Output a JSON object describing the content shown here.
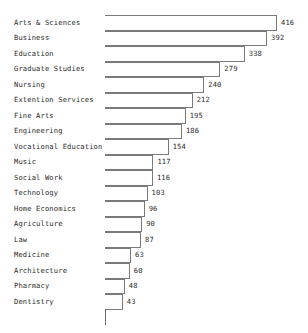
{
  "chart_data": {
    "type": "bar",
    "orientation": "horizontal",
    "title": "",
    "subtitle": "",
    "xlabel": "",
    "ylabel": "",
    "grid": false,
    "legend": false,
    "legend_position": "none",
    "xlim": [
      0,
      416
    ],
    "axis_origin": 0,
    "categories": [
      "Arts & Sciences",
      "Business",
      "Education",
      "Graduate Studies",
      "Nursing",
      "Extention Services",
      "Fine Arts",
      "Engineering",
      "Vocational Education",
      "Music",
      "Social Work",
      "Technology",
      "Home Economics",
      "Agriculture",
      "Law",
      "Medicine",
      "Architecture",
      "Pharmacy",
      "Dentistry"
    ],
    "values": [
      416,
      392,
      338,
      279,
      240,
      212,
      195,
      186,
      154,
      117,
      116,
      103,
      96,
      90,
      87,
      63,
      60,
      48,
      43
    ],
    "value_labels": [
      "416",
      "392",
      "338",
      "279",
      "240",
      "212",
      "195",
      "186",
      "154",
      "117",
      "116",
      "103",
      "96",
      "90",
      "87",
      "63",
      "60",
      "48",
      "43"
    ],
    "colors": {
      "bar_fill": "#ffffff",
      "bar_outline": "#7a7a7a",
      "axis": "#6e6e6e",
      "text": "#2a2a2a",
      "background": "#ffffff"
    }
  }
}
